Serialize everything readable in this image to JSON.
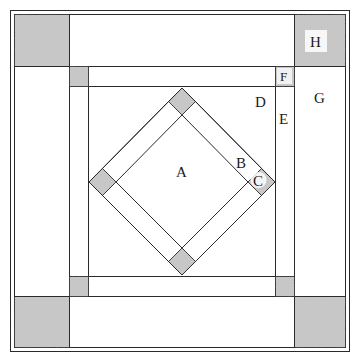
{
  "diagram": {
    "type": "quilt block pattern",
    "colors": {
      "line": "#2a2a2a",
      "shade": "#bdbdbd",
      "background": "#ffffff"
    },
    "labels": {
      "A": "A",
      "B": "B",
      "C": "C",
      "D": "D",
      "E": "E",
      "F": "F",
      "G": "G",
      "H": "H"
    },
    "pieces": [
      {
        "label": "A",
        "role": "center on-point square"
      },
      {
        "label": "B",
        "role": "diamond frame strip"
      },
      {
        "label": "C",
        "role": "shaded diamond corner square"
      },
      {
        "label": "D",
        "role": "setting triangle / inner background"
      },
      {
        "label": "E",
        "role": "inner frame strip"
      },
      {
        "label": "F",
        "role": "small shaded cornerstone"
      },
      {
        "label": "G",
        "role": "outer border strip"
      },
      {
        "label": "H",
        "role": "large shaded corner square"
      }
    ]
  }
}
